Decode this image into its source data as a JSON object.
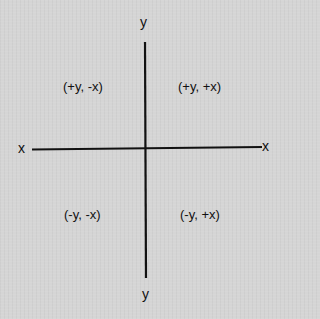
{
  "diagram": {
    "axes": {
      "x_left_label": "x",
      "x_right_label": "x",
      "y_top_label": "y",
      "y_bottom_label": "y"
    },
    "quadrants": {
      "top_left": "(+y, -x)",
      "top_right": "(+y, +x)",
      "bottom_left": "(-y, -x)",
      "bottom_right": "(-y, +x)"
    },
    "colors": {
      "background": "#d5d5d5",
      "axis_line": "#111111",
      "text": "#111111"
    }
  }
}
